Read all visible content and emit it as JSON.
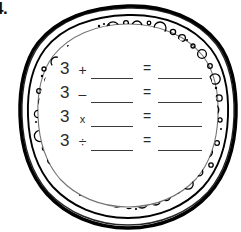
{
  "item": {
    "number_label": "4."
  },
  "figure": {
    "name": "textured-circle",
    "outline_color": "#000000",
    "fill_color": "#ffffff"
  },
  "worksheet": {
    "equals_symbol": "=",
    "blank_placeholder": "",
    "rows": [
      {
        "operand": "3",
        "operator": "+",
        "operand2_blank": "",
        "equals": "=",
        "answer_blank": ""
      },
      {
        "operand": "3",
        "operator": "–",
        "operand2_blank": "",
        "equals": "=",
        "answer_blank": ""
      },
      {
        "operand": "3",
        "operator": "x",
        "operand2_blank": "",
        "equals": "=",
        "answer_blank": ""
      },
      {
        "operand": "3",
        "operator": "÷",
        "operand2_blank": "",
        "equals": "=",
        "answer_blank": ""
      }
    ]
  }
}
